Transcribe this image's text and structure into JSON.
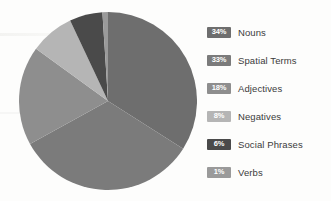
{
  "chart_data": {
    "type": "pie",
    "title": "",
    "subtitle": "",
    "xlabel": "",
    "ylabel": "",
    "legend_position": "right",
    "grid": false,
    "start_angle_deg": 0,
    "direction": "clockwise",
    "categories": [
      "Nouns",
      "Spatial Terms",
      "Adjectives",
      "Negatives",
      "Social Phrases",
      "Verbs"
    ],
    "values": [
      34,
      33,
      18,
      8,
      6,
      1
    ],
    "value_unit": "%",
    "value_labels": [
      "34%",
      "33%",
      "18%",
      "8%",
      "6%",
      "1%"
    ],
    "colors": [
      "#6e6e6e",
      "#7b7b7b",
      "#8e8e8e",
      "#b5b5b5",
      "#4a4a4a",
      "#9a9a9a"
    ],
    "slices": [
      {
        "label": "Nouns",
        "value": 34,
        "display": "34%",
        "color": "#6e6e6e"
      },
      {
        "label": "Spatial Terms",
        "value": 33,
        "display": "33%",
        "color": "#7b7b7b"
      },
      {
        "label": "Adjectives",
        "value": 18,
        "display": "18%",
        "color": "#8e8e8e"
      },
      {
        "label": "Negatives",
        "value": 8,
        "display": "8%",
        "color": "#b5b5b5"
      },
      {
        "label": "Social Phrases",
        "value": 6,
        "display": "6%",
        "color": "#4a4a4a"
      },
      {
        "label": "Verbs",
        "value": 1,
        "display": "1%",
        "color": "#9a9a9a"
      }
    ]
  },
  "legend": {
    "rows": [
      {
        "pct": "34%",
        "label": "Nouns"
      },
      {
        "pct": "33%",
        "label": "Spatial Terms"
      },
      {
        "pct": "18%",
        "label": "Adjectives"
      },
      {
        "pct": "8%",
        "label": "Negatives"
      },
      {
        "pct": "6%",
        "label": "Social Phrases"
      },
      {
        "pct": "1%",
        "label": "Verbs"
      }
    ]
  },
  "colors": {
    "background": "#fdfdfc",
    "text": "#3b3b3b",
    "swatch_text": "#ffffff"
  }
}
